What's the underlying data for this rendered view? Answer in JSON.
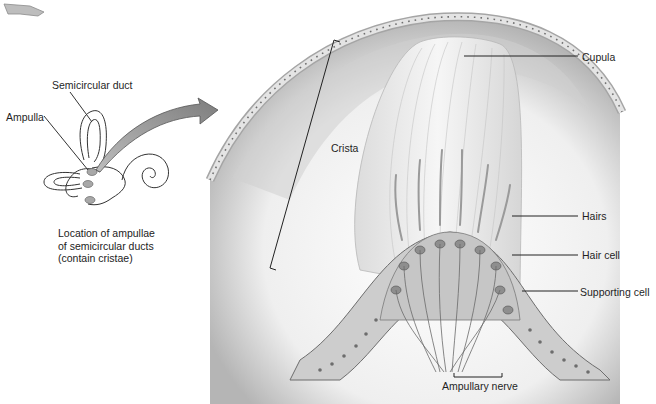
{
  "figure": {
    "inset": {
      "labels": {
        "semicircular_duct": "Semicircular duct",
        "ampulla": "Ampulla"
      },
      "caption": {
        "line1": "Location of ampullae",
        "line2": "of semicircular ducts",
        "line3": "(contain cristae)"
      }
    },
    "main": {
      "labels": {
        "cupula": "Cupula",
        "crista": "Crista",
        "hairs": "Hairs",
        "hair_cell": "Hair cell",
        "supporting_cell": "Supporting cell",
        "ampullary_nerve": "Ampullary nerve"
      }
    },
    "colors": {
      "background": "#ffffff",
      "epithelium": "#d4d4d4",
      "cupula": "#ececec",
      "wall_shadow": "#9a9a9a",
      "nerve": "#6a6a6a",
      "arrow": "#8c8c8c",
      "leader_line": "#222222"
    }
  }
}
